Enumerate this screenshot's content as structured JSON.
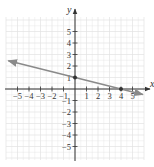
{
  "chart_data": {
    "type": "line",
    "title": "",
    "xlabel": "x",
    "ylabel": "y",
    "xlim": [
      -6,
      6
    ],
    "ylim": [
      -6,
      6
    ],
    "grid": true,
    "x_ticks": [
      -5,
      -4,
      -3,
      -2,
      -1,
      1,
      2,
      3,
      4,
      5
    ],
    "y_ticks": [
      -5,
      -4,
      -3,
      -2,
      -1,
      1,
      2,
      3,
      4,
      5
    ],
    "x_tick_labels": [
      "−5",
      "−4",
      "−3",
      "−2",
      "−1",
      "1",
      "2",
      "3",
      "4",
      "5"
    ],
    "y_tick_labels": [
      "−5",
      "−4",
      "−3",
      "−2",
      "−1",
      "1",
      "2",
      "3",
      "4",
      "5"
    ],
    "series": [
      {
        "name": "line",
        "equation": "y = -x/4 + 1",
        "slope": -0.25,
        "intercept": 1,
        "x": [
          -5.8,
          5.9
        ],
        "y": [
          2.45,
          -0.475
        ],
        "arrows": "both"
      }
    ],
    "points": [
      {
        "x": 0,
        "y": 1,
        "label": "y-intercept"
      },
      {
        "x": 4,
        "y": 0,
        "label": "x-intercept"
      }
    ]
  },
  "colors": {
    "grid": "#e2e2e2",
    "axis": "#333333",
    "line": "#8a8a8a",
    "point": "#333333"
  },
  "layout": {
    "origin_px": [
      75,
      89
    ],
    "unit_px": 11.5
  }
}
